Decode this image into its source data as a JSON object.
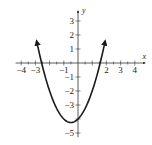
{
  "chart_data": {
    "type": "line",
    "title": "",
    "xlabel": "x",
    "ylabel": "y",
    "xlim": [
      -4.4,
      4.6
    ],
    "ylim": [
      -5.3,
      3.6
    ],
    "grid": false,
    "legend": null,
    "x_tick_labels": [
      "-4",
      "-3",
      "-1",
      "2",
      "3",
      "4"
    ],
    "x_ticks": [
      -4,
      -3,
      -2,
      -1,
      1,
      2,
      3,
      4
    ],
    "y_tick_labels": [
      "3",
      "2",
      "1",
      "-1",
      "-2",
      "-3",
      "-5"
    ],
    "y_ticks": [
      3,
      2,
      1,
      -1,
      -2,
      -3,
      -4,
      -5
    ],
    "series": [
      {
        "name": "parabola",
        "equation": "y = x^2 + x - 4",
        "vertex": [
          -0.5,
          -4.25
        ],
        "x": [
          -2.9,
          -2.5,
          -2,
          -1.5,
          -1,
          -0.5,
          0,
          0.5,
          1,
          1.5,
          1.9
        ],
        "y": [
          1.51,
          -0.25,
          -2,
          -3.25,
          -4,
          -4.25,
          -4,
          -3.25,
          -2,
          -0.25,
          1.51
        ],
        "arrows": "both-ends"
      }
    ]
  },
  "colors": {
    "curve": "#1a1a1a",
    "axis": "#333333",
    "background": "#ffffff"
  }
}
